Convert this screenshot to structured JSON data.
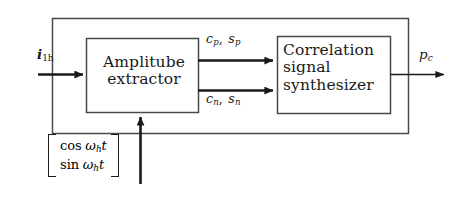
{
  "diagram": {
    "colors": {
      "line": "#4a4a4a",
      "arrow": "#1a1a1a",
      "text": "#1a1a1a",
      "background": "#ffffff"
    },
    "outer_boundary": {
      "name": "system-boundary"
    },
    "blocks": [
      {
        "id": "amplitube-extractor",
        "line1": "Amplitube",
        "line2": "extractor",
        "text": "Amplitube extractor"
      },
      {
        "id": "correlation-signal-synthesizer",
        "line1": "Correlation",
        "line2": "signal",
        "line3": "synthesizer",
        "text": "Correlation signal synthesizer"
      }
    ],
    "input": {
      "symbol": "i",
      "subscript": "1h",
      "text": "i1h"
    },
    "output": {
      "symbol": "p",
      "subscript": "c",
      "text": "pc"
    },
    "signals": [
      {
        "id": "positive-sequence",
        "sym1": "c",
        "sub1": "p",
        "sym2": "s",
        "sub2": "p",
        "separator": ",",
        "text": "cp, sp"
      },
      {
        "id": "negative-sequence",
        "sym1": "c",
        "sub1": "n",
        "sym2": "s",
        "sub2": "n",
        "separator": ",",
        "text": "cn, sn"
      }
    ],
    "reference_vector": {
      "id": "oscillator-reference",
      "row1": {
        "fn": "cos",
        "omega": "ω",
        "sub": "h",
        "var": "t",
        "text": "cos ωh t"
      },
      "row2": {
        "fn": "sin",
        "omega": "ω",
        "sub": "h",
        "var": "t",
        "text": "sin ωh t"
      },
      "text": "[cos ωh t ; sin ωh t]"
    }
  }
}
